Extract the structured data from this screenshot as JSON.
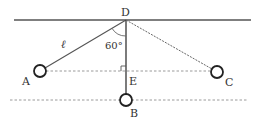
{
  "diagram": {
    "type": "pendulum",
    "colors": {
      "line": "#444444",
      "dashed": "#9a9a9a",
      "text": "#333333",
      "bob_fill": "#ffffff"
    },
    "points": {
      "D": {
        "label": "D"
      },
      "A": {
        "label": "A"
      },
      "B": {
        "label": "B"
      },
      "C": {
        "label": "C"
      },
      "E": {
        "label": "E"
      }
    },
    "string_length_label": "ℓ",
    "angle_label": "60°"
  }
}
